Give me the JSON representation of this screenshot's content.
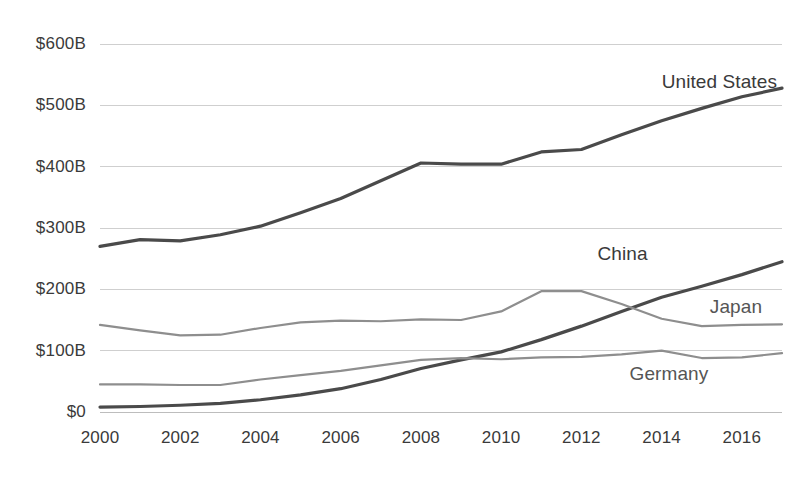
{
  "chart_data": {
    "type": "line",
    "title": "",
    "subtitle": "",
    "xlabel": "",
    "ylabel": "",
    "x": [
      2000,
      2001,
      2002,
      2003,
      2004,
      2005,
      2006,
      2007,
      2008,
      2009,
      2010,
      2011,
      2012,
      2013,
      2014,
      2015,
      2016,
      2017
    ],
    "xlim": [
      2000,
      2017
    ],
    "ylim": [
      0,
      600
    ],
    "y_unit": "B",
    "y_prefix": "$",
    "grid": true,
    "legend_position": "inline-right",
    "x_tick_labels": [
      "2000",
      "2002",
      "2004",
      "2006",
      "2008",
      "2010",
      "2012",
      "2014",
      "2016"
    ],
    "x_tick_values": [
      2000,
      2002,
      2004,
      2006,
      2008,
      2010,
      2012,
      2014,
      2016
    ],
    "y_tick_labels": [
      "$0",
      "$100B",
      "$200B",
      "$300B",
      "$400B",
      "$500B",
      "$600B"
    ],
    "y_tick_values": [
      0,
      100,
      200,
      300,
      400,
      500,
      600
    ],
    "series": [
      {
        "name": "United States",
        "color": "#4a4a4a",
        "weight": "heavy",
        "label_x": 2014.0,
        "label_y": 538,
        "values": [
          270,
          281,
          279,
          289,
          303,
          325,
          348,
          377,
          406,
          404,
          404,
          424,
          428,
          452,
          475,
          495,
          514,
          528
        ]
      },
      {
        "name": "China",
        "color": "#4a4a4a",
        "weight": "heavy",
        "label_x": 2012.4,
        "label_y": 258,
        "values": [
          8,
          9,
          11,
          14,
          20,
          28,
          38,
          53,
          71,
          85,
          98,
          118,
          140,
          164,
          187,
          205,
          224,
          245
        ]
      },
      {
        "name": "Japan",
        "color": "#8e8e8e",
        "weight": "light",
        "label_x": 2015.2,
        "label_y": 172,
        "values": [
          142,
          133,
          125,
          126,
          137,
          146,
          149,
          148,
          151,
          150,
          164,
          197,
          197,
          176,
          152,
          140,
          142,
          143
        ]
      },
      {
        "name": "Germany",
        "color": "#8e8e8e",
        "weight": "light",
        "label_x": 2013.2,
        "label_y": 62,
        "values": [
          45,
          45,
          44,
          44,
          53,
          60,
          67,
          76,
          85,
          88,
          86,
          89,
          90,
          94,
          100,
          88,
          89,
          96
        ]
      }
    ]
  }
}
